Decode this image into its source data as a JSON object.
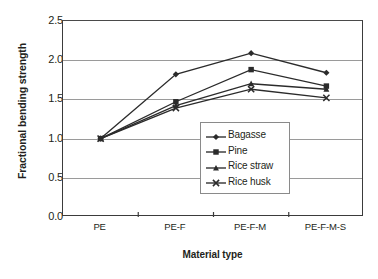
{
  "chart_data": {
    "type": "line",
    "title": "",
    "xlabel": "Material type",
    "ylabel": "Fractional bending strength",
    "categories": [
      "PE",
      "PE-F",
      "PE-F-M",
      "PE-F-M-S"
    ],
    "ylim": [
      0.0,
      2.5
    ],
    "ytick_step": 0.5,
    "ytick_labels": [
      "0.0",
      "0.5",
      "1.0",
      "1.5",
      "2.0",
      "2.5"
    ],
    "grid": true,
    "legend_position": "lower-right-inside",
    "series": [
      {
        "name": "Bagasse",
        "marker": "diamond",
        "color": "#2b2b2b",
        "values": [
          1.0,
          1.82,
          2.09,
          1.84
        ]
      },
      {
        "name": "Pine",
        "marker": "square",
        "color": "#2b2b2b",
        "values": [
          1.0,
          1.47,
          1.88,
          1.67
        ]
      },
      {
        "name": "Rice straw",
        "marker": "triangle",
        "color": "#2b2b2b",
        "values": [
          1.0,
          1.42,
          1.7,
          1.63
        ]
      },
      {
        "name": "Rice husk",
        "marker": "x",
        "color": "#2b2b2b",
        "values": [
          1.0,
          1.39,
          1.63,
          1.52
        ]
      }
    ]
  }
}
